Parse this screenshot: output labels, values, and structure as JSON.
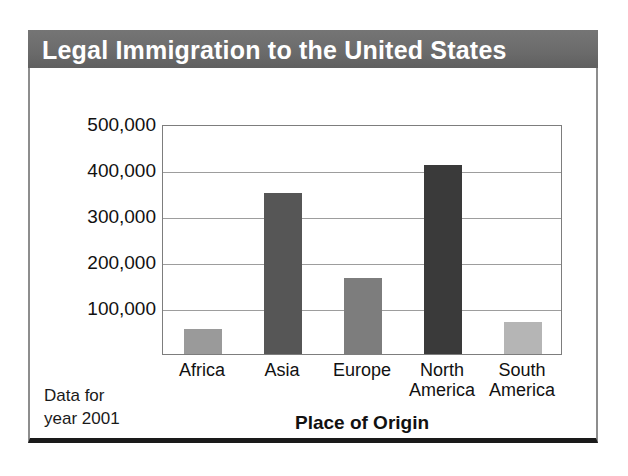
{
  "chart_data": {
    "type": "bar",
    "title": "Legal Immigration to the United States",
    "xlabel": "Place of Origin",
    "ylabel": "Number of People",
    "categories": [
      "Africa",
      "Asia",
      "Europe",
      "North\nAmerica",
      "South\nAmerica"
    ],
    "values": [
      55000,
      350000,
      165000,
      410000,
      70000
    ],
    "bar_colors": [
      "#9a9a9a",
      "#565656",
      "#7d7d7d",
      "#3a3a3a",
      "#b5b5b5"
    ],
    "ylim": [
      0,
      500000
    ],
    "ytick_labels": [
      "100,000",
      "200,000",
      "300,000",
      "400,000",
      "500,000"
    ],
    "ytick_values": [
      100000,
      200000,
      300000,
      400000,
      500000
    ],
    "grid": true,
    "legend": "none",
    "annotation": "Data for\nyear 2001"
  },
  "figure": {
    "banner_color": "#6b6b6b",
    "banner_text_color": "#ffffff",
    "frame_color": "#7d7d7d",
    "background": "#ffffff"
  }
}
